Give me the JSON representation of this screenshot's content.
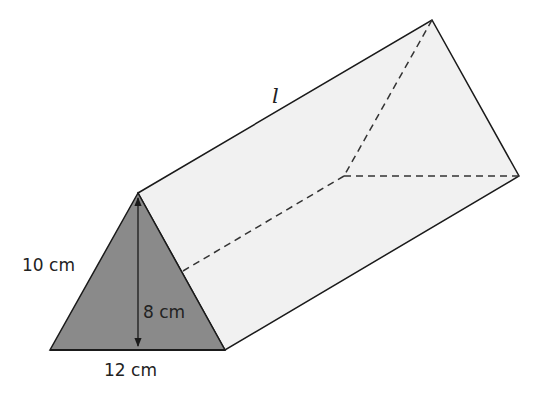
{
  "diagram": {
    "type": "triangular-prism",
    "colors": {
      "front_face": "#8a8a8a",
      "side_faces": "#f1f1f1",
      "edges": "#1a1a1a",
      "background": "#ffffff"
    },
    "labels": {
      "length": "l",
      "slant_side": "10 cm",
      "height": "8 cm",
      "base": "12 cm"
    },
    "vertices": {
      "front_apex": [
        138,
        193
      ],
      "front_bottom_left": [
        50,
        350
      ],
      "front_bottom_right": [
        225,
        350
      ],
      "back_apex": [
        432,
        20
      ],
      "back_bottom_right": [
        519,
        176
      ],
      "back_bottom_left_hidden": [
        344,
        176
      ]
    }
  }
}
